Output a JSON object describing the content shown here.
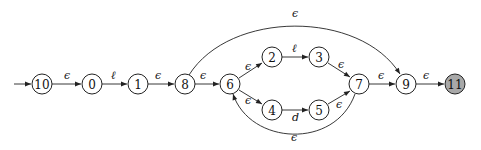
{
  "diagram": {
    "type": "nfa",
    "colors": {
      "stroke": "#222222",
      "accept_fill": "#a8a8a8",
      "node_fill": "#ffffff"
    },
    "start_state": "10",
    "accept_states": [
      "11"
    ],
    "nodes": [
      {
        "id": "10",
        "label": "10",
        "x": 42,
        "y": 84,
        "accept": false
      },
      {
        "id": "0",
        "label": "0",
        "x": 92,
        "y": 84,
        "accept": false
      },
      {
        "id": "1",
        "label": "1",
        "x": 138,
        "y": 84,
        "accept": false
      },
      {
        "id": "8",
        "label": "8",
        "x": 185,
        "y": 84,
        "accept": false
      },
      {
        "id": "6",
        "label": "6",
        "x": 230,
        "y": 84,
        "accept": false
      },
      {
        "id": "2",
        "label": "2",
        "x": 272,
        "y": 57,
        "accept": false
      },
      {
        "id": "3",
        "label": "3",
        "x": 319,
        "y": 57,
        "accept": false
      },
      {
        "id": "4",
        "label": "4",
        "x": 272,
        "y": 110,
        "accept": false
      },
      {
        "id": "5",
        "label": "5",
        "x": 319,
        "y": 110,
        "accept": false
      },
      {
        "id": "7",
        "label": "7",
        "x": 359,
        "y": 84,
        "accept": false
      },
      {
        "id": "9",
        "label": "9",
        "x": 406,
        "y": 84,
        "accept": false
      },
      {
        "id": "11",
        "label": "11",
        "x": 455,
        "y": 84,
        "accept": true
      }
    ],
    "edges": [
      {
        "from": "start",
        "to": "10",
        "label": ""
      },
      {
        "from": "10",
        "to": "0",
        "label": "ϵ"
      },
      {
        "from": "0",
        "to": "1",
        "label": "ℓ"
      },
      {
        "from": "1",
        "to": "8",
        "label": "ϵ"
      },
      {
        "from": "8",
        "to": "6",
        "label": "ϵ"
      },
      {
        "from": "6",
        "to": "2",
        "label": "ϵ"
      },
      {
        "from": "2",
        "to": "3",
        "label": "ℓ"
      },
      {
        "from": "3",
        "to": "7",
        "label": "ϵ"
      },
      {
        "from": "6",
        "to": "4",
        "label": "ϵ"
      },
      {
        "from": "4",
        "to": "5",
        "label": "d"
      },
      {
        "from": "5",
        "to": "7",
        "label": "ϵ"
      },
      {
        "from": "7",
        "to": "9",
        "label": "ϵ"
      },
      {
        "from": "9",
        "to": "11",
        "label": "ϵ"
      },
      {
        "from": "8",
        "to": "9",
        "label": "ϵ",
        "curve": "over"
      },
      {
        "from": "7",
        "to": "6",
        "label": "ϵ",
        "curve": "under"
      }
    ]
  }
}
